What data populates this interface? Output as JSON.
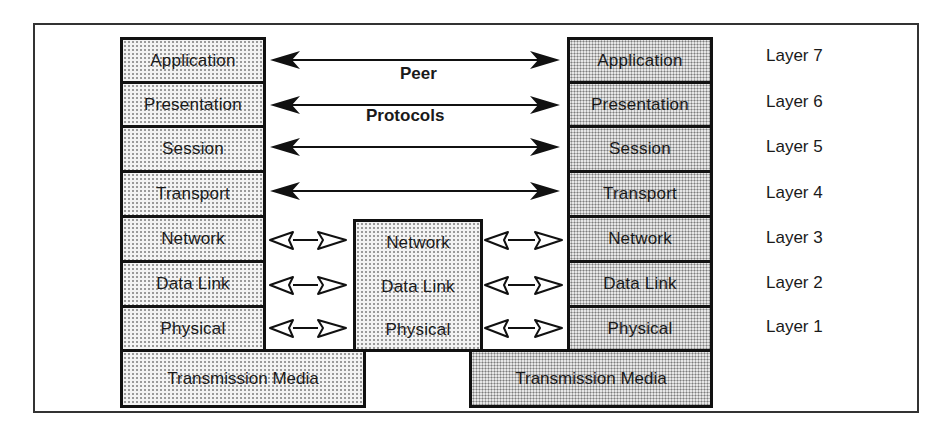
{
  "diagram": {
    "title_lines": [
      "Peer",
      "Protocols"
    ],
    "left_stack": {
      "layers": [
        "Application",
        "Presentation",
        "Session",
        "Transport",
        "Network",
        "Data Link",
        "Physical"
      ],
      "media": "Transmission Media"
    },
    "middle_stack": {
      "layers": [
        "Network",
        "Data Link",
        "Physical"
      ]
    },
    "right_stack": {
      "layers": [
        "Application",
        "Presentation",
        "Session",
        "Transport",
        "Network",
        "Data Link",
        "Physical"
      ],
      "media": "Transmission Media"
    },
    "layer_labels": [
      "Layer 7",
      "Layer 6",
      "Layer 5",
      "Layer 4",
      "Layer 3",
      "Layer 2",
      "Layer 1"
    ],
    "arrows": {
      "peer_protocol_arrows": [
        "Application",
        "Presentation",
        "Session",
        "Transport"
      ],
      "hop_arrows": [
        "Network",
        "Data Link",
        "Physical"
      ],
      "peer_style": "solid-double-headed",
      "hop_style": "hollow-double-headed"
    },
    "colors": {
      "line": "#111111",
      "shade_light": "#f3f3f3",
      "shade_dark": "#e6e6e6",
      "background": "#ffffff"
    }
  }
}
